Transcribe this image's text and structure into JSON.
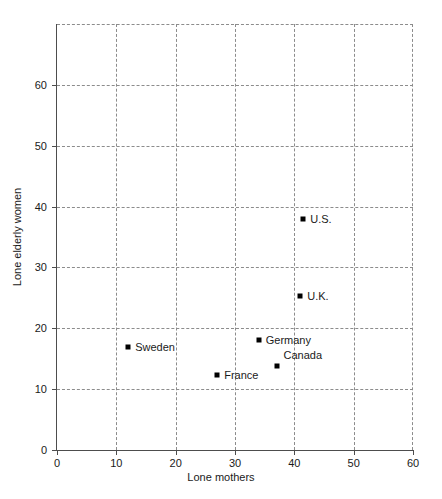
{
  "chart_data": {
    "type": "scatter",
    "title": "",
    "xlabel": "Lone mothers",
    "ylabel": "Lone elderly women",
    "xlim": [
      0,
      60
    ],
    "ylim": [
      0,
      70
    ],
    "xticks": [
      0,
      10,
      20,
      30,
      40,
      50,
      60
    ],
    "yticks": [
      0,
      10,
      20,
      30,
      40,
      50,
      60
    ],
    "xticklabels": [
      "0",
      "10",
      "20",
      "30",
      "40",
      "50",
      "60"
    ],
    "yticklabels": [
      "0",
      "10",
      "20",
      "30",
      "40",
      "50",
      "60"
    ],
    "grid": true,
    "grid_style": "dashed",
    "legend": "none",
    "marker": "square",
    "marker_color": "#000000",
    "points": [
      {
        "label": "Sweden",
        "x": 12.0,
        "y": 17.0,
        "label_side": "right"
      },
      {
        "label": "France",
        "x": 27.0,
        "y": 12.3,
        "label_side": "right"
      },
      {
        "label": "Germany",
        "x": 34.0,
        "y": 18.0,
        "label_side": "right"
      },
      {
        "label": "Canada",
        "x": 37.0,
        "y": 13.8,
        "label_side": "right-above"
      },
      {
        "label": "U.K.",
        "x": 41.0,
        "y": 25.3,
        "label_side": "right"
      },
      {
        "label": "U.S.",
        "x": 41.5,
        "y": 38.0,
        "label_side": "right"
      }
    ]
  },
  "colors": {
    "background": "#ffffff",
    "axis": "#4d4d4d",
    "grid": "#8c8c8c",
    "text": "#1a1a1a",
    "marker": "#000000"
  }
}
